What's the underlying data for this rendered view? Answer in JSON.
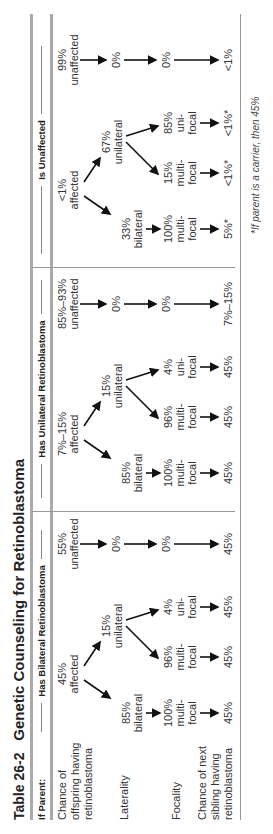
{
  "title": {
    "number": "Table 26-2",
    "text": "Genetic Counseling for Retinoblastoma"
  },
  "row_header": "If Parent:",
  "row_labels": [
    "Chance of offspring having retinoblastoma",
    "Laterality",
    "Focality",
    "Chance of next sibling having retinoblastoma"
  ],
  "groups": [
    {
      "header": "Has Bilateral Retinoblastoma",
      "affected": {
        "pct": "45%",
        "label": "affected"
      },
      "unaffected": {
        "pct": "55%",
        "label": "unaffected"
      },
      "bilateral": {
        "pct": "85%",
        "label": "bilateral"
      },
      "unilateral": {
        "pct": "15%",
        "label": "unilateral"
      },
      "bi_multifocal": {
        "pct": "100%",
        "l1": "multi-",
        "l2": "focal"
      },
      "uni_multifocal": {
        "pct": "96%",
        "l1": "multi-",
        "l2": "focal"
      },
      "uni_unifocal": {
        "pct": "4%",
        "l1": "uni-",
        "l2": "focal"
      },
      "unaffected_laterality": "0%",
      "unaffected_focality": "0%",
      "sibling": [
        "45%",
        "45%",
        "45%",
        "45%"
      ]
    },
    {
      "header": "Has Unilateral Retinoblastoma",
      "affected": {
        "pct": "7%–15%",
        "label": "affected"
      },
      "unaffected": {
        "pct": "85%–93%",
        "label": "unaffected"
      },
      "bilateral": {
        "pct": "85%",
        "label": "bilateral"
      },
      "unilateral": {
        "pct": "15%",
        "label": "unilateral"
      },
      "bi_multifocal": {
        "pct": "100%",
        "l1": "multi-",
        "l2": "focal"
      },
      "uni_multifocal": {
        "pct": "96%",
        "l1": "multi-",
        "l2": "focal"
      },
      "uni_unifocal": {
        "pct": "4%",
        "l1": "uni-",
        "l2": "focal"
      },
      "unaffected_laterality": "0%",
      "unaffected_focality": "0%",
      "sibling": [
        "45%",
        "45%",
        "45%",
        "7%–15%"
      ]
    },
    {
      "header": "Is Unaffected",
      "affected": {
        "pct": "<1%",
        "label": "affected"
      },
      "unaffected": {
        "pct": "99%",
        "label": "unaffected"
      },
      "bilateral": {
        "pct": "33%",
        "label": "bilateral"
      },
      "unilateral": {
        "pct": "67%",
        "label": "unilateral"
      },
      "bi_multifocal": {
        "pct": "100%",
        "l1": "multi-",
        "l2": "focal"
      },
      "uni_multifocal": {
        "pct": "15%",
        "l1": "multi-",
        "l2": "focal"
      },
      "uni_unifocal": {
        "pct": "85%",
        "l1": "uni-",
        "l2": "focal"
      },
      "unaffected_laterality": "0%",
      "unaffected_focality": "0%",
      "sibling": [
        "5%*",
        "<1%*",
        "<1%*",
        "<1%"
      ]
    }
  ],
  "footnote": "*If parent is a carrier, then 45%"
}
